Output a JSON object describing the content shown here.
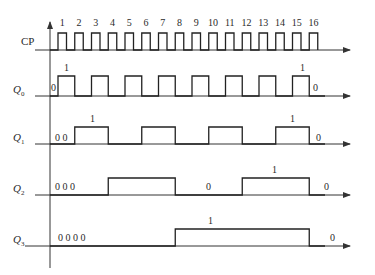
{
  "x_axis": {
    "start": 50,
    "end": 352
  },
  "clock": {
    "label": "CP",
    "pulse_numbers": [
      "1",
      "2",
      "3",
      "4",
      "5",
      "6",
      "7",
      "8",
      "9",
      "10",
      "11",
      "12",
      "13",
      "14",
      "15",
      "16"
    ]
  },
  "signals": [
    {
      "name": "Q",
      "sub": "0",
      "start_label": "0",
      "high_label": "1",
      "high_label2": "1",
      "end_label": "0",
      "period_pulses": 1
    },
    {
      "name": "Q",
      "sub": "1",
      "start_label": "0 0",
      "high_label": "1",
      "high_label2": "1",
      "end_label": "0",
      "period_pulses": 2
    },
    {
      "name": "Q",
      "sub": "2",
      "start_label": "0 0 0",
      "mid_label": "0",
      "high_label": "1",
      "end_label": "0",
      "period_pulses": 4
    },
    {
      "name": "Q",
      "sub": "3",
      "start_label": "0 0 0 0",
      "high_label": "1",
      "end_label": "0",
      "period_pulses": 8
    }
  ]
}
